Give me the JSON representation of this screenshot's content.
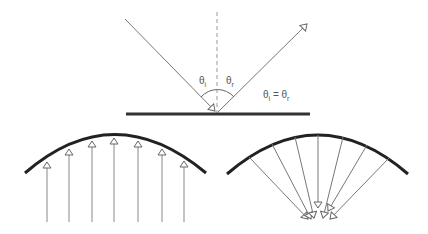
{
  "diagram": {
    "top": {
      "name": "law-of-reflection",
      "labels": {
        "theta": "θ",
        "incident_sub": "i",
        "reflected_sub": "r",
        "equation_lhs": "θ",
        "equation_lhs_sub": "i",
        "equation_eq": " = ",
        "equation_rhs": "θ",
        "equation_rhs_sub": "r"
      },
      "surface": {
        "x1": 126,
        "x2": 310,
        "y": 114
      },
      "normal": {
        "x": 217,
        "y1": 12,
        "y2": 114
      },
      "incident_ray": {
        "x1": 125,
        "y1": 19,
        "x2": 217,
        "y2": 112
      },
      "reflected_ray": {
        "x1": 217,
        "y1": 112,
        "x2": 308,
        "y2": 23
      }
    },
    "bottom_left": {
      "name": "convex-mirror-parallel-rays",
      "arc": {
        "x1": 25,
        "y1": 173,
        "peak_x": 114,
        "peak_y": 134,
        "x2": 206,
        "y2": 173
      },
      "ray_x": [
        47,
        69,
        92,
        114,
        138,
        162,
        184
      ],
      "ray_bottom_y": 222
    },
    "bottom_right": {
      "name": "concave-mirror-focused-rays",
      "arc": {
        "x1": 227,
        "y1": 174,
        "peak_x": 318,
        "peak_y": 134,
        "x2": 408,
        "y2": 174
      },
      "ray_start_x": [
        249,
        272,
        295,
        318,
        343,
        367,
        389
      ],
      "focus": {
        "x": 318,
        "y": 222
      }
    },
    "colors": {
      "surface": "#333333",
      "ray": "#888888",
      "normal": "#999999"
    }
  }
}
